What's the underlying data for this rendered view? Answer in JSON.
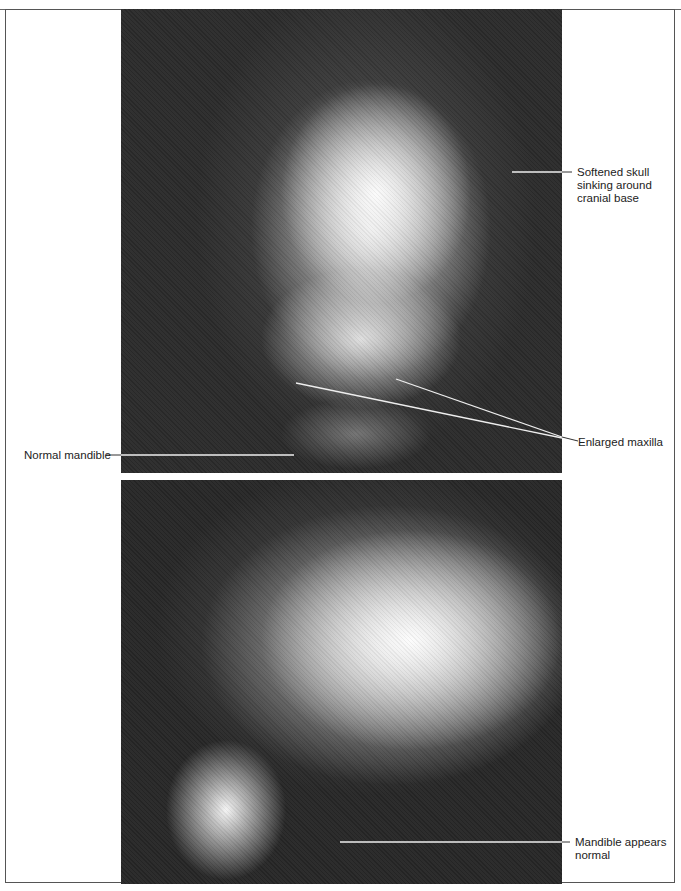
{
  "figure": {
    "panels": [
      {
        "id": "frontal",
        "description": "Frontal skull radiograph"
      },
      {
        "id": "lateral",
        "description": "Lateral skull radiograph"
      }
    ],
    "annotations": {
      "softened_skull": "Softened skull sinking around cranial base",
      "softened_skull_lines": [
        "Softened skull",
        "sinking around",
        "cranial base"
      ],
      "enlarged_maxilla": "Enlarged maxilla",
      "normal_mandible": "Normal mandible",
      "mandible_appears_normal_lines": [
        "Mandible appears",
        "normal"
      ]
    },
    "colors": {
      "background": "#ffffff",
      "xray_dark": "#2a2a2a",
      "leader_line": "#f0f0f0",
      "text": "#222222"
    }
  }
}
